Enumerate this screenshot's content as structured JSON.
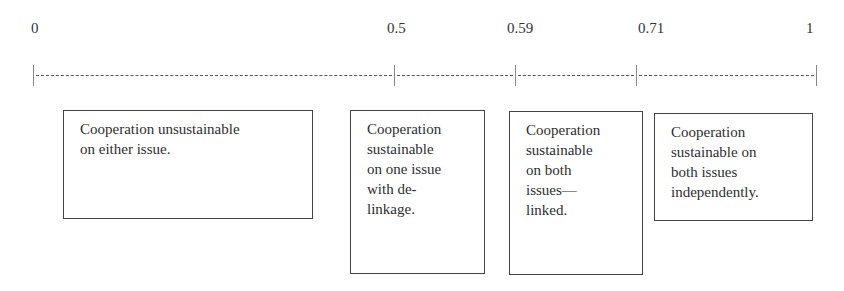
{
  "axis": {
    "ticks": [
      {
        "label": "0",
        "value": 0
      },
      {
        "label": "0.5",
        "value": 0.5
      },
      {
        "label": "0.59",
        "value": 0.59
      },
      {
        "label": "0.71",
        "value": 0.71
      },
      {
        "label": "1",
        "value": 1
      }
    ]
  },
  "regions": [
    {
      "range": "0–0.5",
      "text": "Cooperation unsustainable on either issue."
    },
    {
      "range": "0.5–0.59",
      "text": "Cooperation sustainable on one issue with de-linkage."
    },
    {
      "range": "0.59–0.71",
      "text": "Cooperation sustainable on both issues—linked."
    },
    {
      "range": "0.71–1",
      "text": "Cooperation sustainable on both issues independently."
    }
  ],
  "region_lines": [
    [
      "Cooperation unsustainable",
      "on either issue."
    ],
    [
      "Cooperation",
      "sustainable",
      "on one issue",
      "with de-",
      "linkage."
    ],
    [
      "Cooperation",
      "sustainable",
      "on both",
      "issues—",
      "linked."
    ],
    [
      "Cooperation",
      "sustainable on",
      "both issues",
      "independently."
    ]
  ]
}
